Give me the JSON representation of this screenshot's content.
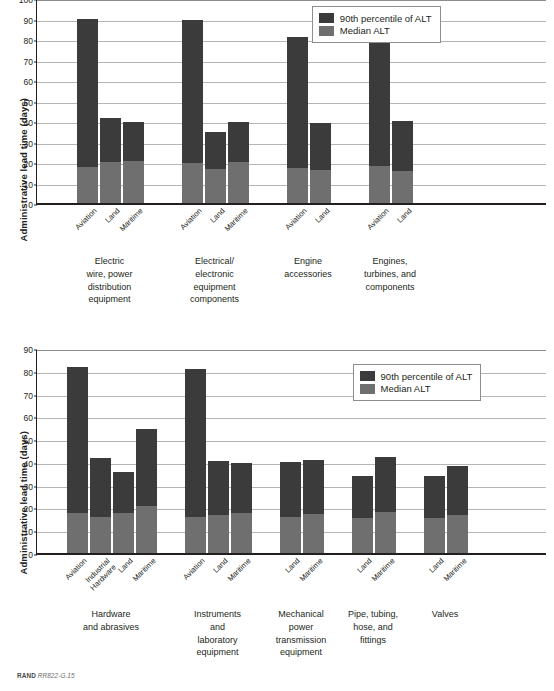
{
  "footer": {
    "brand": "RAND",
    "figure_id": "RR822-G.15"
  },
  "legend": {
    "items": [
      {
        "label": "90th percentile of ALT",
        "color": "#3b3b3b"
      },
      {
        "label": "Median ALT",
        "color": "#6f6f6f"
      }
    ]
  },
  "chart_data": [
    {
      "id": "chart-top",
      "type": "bar",
      "stacked": true,
      "title": "",
      "xlabel": "",
      "ylabel": "Administrative lead time (days)",
      "ylim": [
        0,
        100
      ],
      "yticks": [
        0,
        10,
        20,
        30,
        40,
        50,
        60,
        70,
        80,
        90,
        100
      ],
      "grid": true,
      "legend_position": "top-right",
      "series": [
        {
          "name": "90th percentile of ALT",
          "color": "#3b3b3b"
        },
        {
          "name": "Median ALT",
          "color": "#6f6f6f"
        }
      ],
      "groups": [
        {
          "label": "Electric wire, power distribution equipment",
          "label_lines": [
            "Electric",
            "wire, power",
            "distribution",
            "equipment"
          ],
          "bars": [
            {
              "category": "Aviation",
              "p90": 90.0,
              "median": 17.5
            },
            {
              "category": "Land",
              "p90": 41.5,
              "median": 20.0
            },
            {
              "category": "Maritime",
              "p90": 39.5,
              "median": 20.5
            }
          ]
        },
        {
          "label": "Electrical/electronic equipment components",
          "label_lines": [
            "Electrical/",
            "electronic",
            "equipment",
            "components"
          ],
          "bars": [
            {
              "category": "Aviation",
              "p90": 89.5,
              "median": 19.5
            },
            {
              "category": "Land",
              "p90": 34.5,
              "median": 16.5
            },
            {
              "category": "Maritime",
              "p90": 39.5,
              "median": 20.0
            }
          ]
        },
        {
          "label": "Engine accessories",
          "label_lines": [
            "Engine",
            "accessories"
          ],
          "bars": [
            {
              "category": "Aviation",
              "p90": 81.0,
              "median": 17.0
            },
            {
              "category": "Land",
              "p90": 39.0,
              "median": 16.0
            }
          ]
        },
        {
          "label": "Engines, turbines, and components",
          "label_lines": [
            "Engines,",
            "turbines, and",
            "components"
          ],
          "bars": [
            {
              "category": "Aviation",
              "p90": 94.5,
              "median": 18.0
            },
            {
              "category": "Land",
              "p90": 40.0,
              "median": 15.5
            }
          ]
        }
      ]
    },
    {
      "id": "chart-bottom",
      "type": "bar",
      "stacked": true,
      "title": "",
      "xlabel": "",
      "ylabel": "Administrative lead time (days)",
      "ylim": [
        0,
        90
      ],
      "yticks": [
        0,
        10,
        20,
        30,
        40,
        50,
        60,
        70,
        80,
        90
      ],
      "grid": true,
      "legend_position": "top-right",
      "series": [
        {
          "name": "90th percentile of ALT",
          "color": "#3b3b3b"
        },
        {
          "name": "Median ALT",
          "color": "#6f6f6f"
        }
      ],
      "groups": [
        {
          "label": "Hardware and abrasives",
          "label_lines": [
            "Hardware",
            "and abrasives"
          ],
          "bars": [
            {
              "category": "Aviation",
              "p90": 81.5,
              "median": 17.5
            },
            {
              "category": "Industrial Hardware",
              "p90": 41.5,
              "median": 16.0
            },
            {
              "category": "Land",
              "p90": 35.5,
              "median": 17.5
            },
            {
              "category": "Maritime",
              "p90": 54.5,
              "median": 20.5
            }
          ]
        },
        {
          "label": "Instruments and laboratory equipment",
          "label_lines": [
            "Instruments",
            "and",
            "laboratory",
            "equipment"
          ],
          "bars": [
            {
              "category": "Aviation",
              "p90": 81.0,
              "median": 16.0
            },
            {
              "category": "Land",
              "p90": 40.5,
              "median": 16.5
            },
            {
              "category": "Maritime",
              "p90": 39.5,
              "median": 17.5
            }
          ]
        },
        {
          "label": "Mechanical power transmission equipment",
          "label_lines": [
            "Mechanical",
            "power",
            "transmission",
            "equipment"
          ],
          "bars": [
            {
              "category": "Land",
              "p90": 40.0,
              "median": 16.0
            },
            {
              "category": "Maritime",
              "p90": 41.0,
              "median": 17.0
            }
          ]
        },
        {
          "label": "Pipe, tubing, hose, and fittings",
          "label_lines": [
            "Pipe, tubing,",
            "hose, and",
            "fittings"
          ],
          "bars": [
            {
              "category": "Land",
              "p90": 34.0,
              "median": 15.5
            },
            {
              "category": "Maritime",
              "p90": 42.0,
              "median": 18.0
            }
          ]
        },
        {
          "label": "Valves",
          "label_lines": [
            "Valves"
          ],
          "bars": [
            {
              "category": "Land",
              "p90": 34.0,
              "median": 15.5
            },
            {
              "category": "Maritime",
              "p90": 38.0,
              "median": 16.5
            }
          ]
        }
      ]
    }
  ]
}
